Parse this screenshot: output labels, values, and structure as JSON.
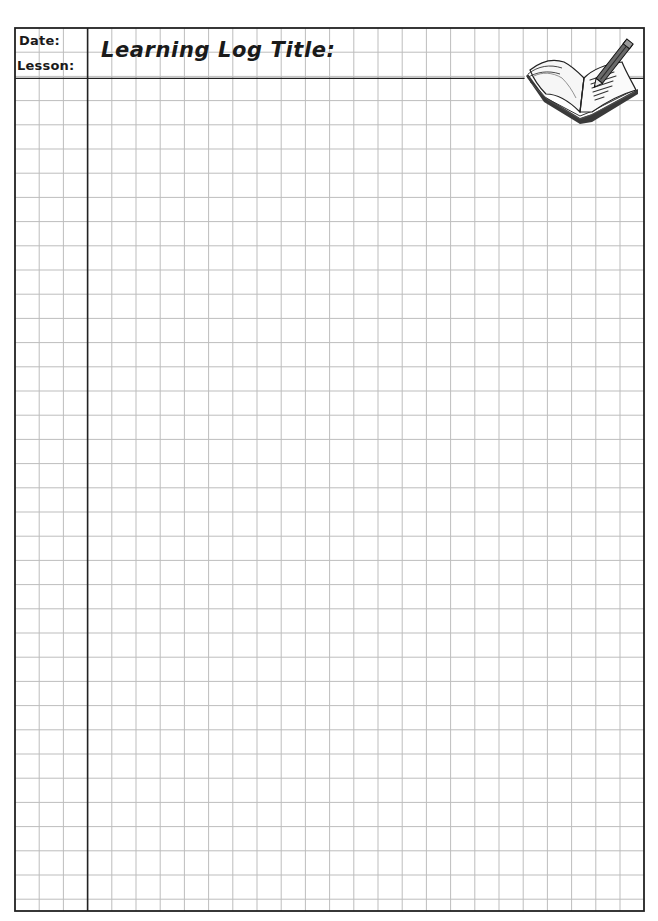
{
  "header": {
    "date_label": "Date:",
    "lesson_label": "Lesson:",
    "title_label": "Learning Log Title:"
  },
  "grid": {
    "left": 15,
    "right": 644,
    "top": 28,
    "bottom": 911,
    "cell_size": 24.2,
    "columns": 26,
    "full_rows": 36,
    "margin_column_x": 87.6,
    "header_line_y": 78.4,
    "line_color": "#bdbdbd",
    "border_color": "#222222"
  },
  "illustration": {
    "icon": "open-book-with-pencil-icon"
  }
}
